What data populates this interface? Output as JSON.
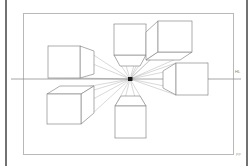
{
  "diagram": {
    "type": "one-point-perspective-construction",
    "horizon_label": "HL",
    "corner_mark": "PP",
    "colors": {
      "paper": "#ffffff",
      "frame_stroke": "#b4b4b4",
      "cube_stroke": "#8c8c8c",
      "ray_stroke": "#a8a8a8",
      "horizon_stroke": "#909090",
      "vanishing_point": "#1a1a1a",
      "scan_edge": "#4a4a4a"
    },
    "frame": {
      "x": 23,
      "y": 13,
      "width": 211,
      "height": 142
    },
    "horizon": {
      "y": 79,
      "x_start": 11,
      "x_end": 241
    },
    "vanishing_point": {
      "x": 130,
      "y": 79,
      "label": "VP"
    },
    "cubes": [
      {
        "name": "top-center-cube",
        "position": "above-vp",
        "visible_face": "bottom"
      },
      {
        "name": "top-right-cube",
        "position": "upper-right-of-vp",
        "visible_face": "bottom-left"
      },
      {
        "name": "upper-left-cube",
        "position": "left-above-horizon",
        "visible_face": "right"
      },
      {
        "name": "lower-left-cube",
        "position": "left-below-horizon",
        "visible_face": "top-right"
      },
      {
        "name": "right-cube",
        "position": "right-on-horizon",
        "visible_face": "left"
      },
      {
        "name": "bottom-center-cube",
        "position": "below-vp",
        "visible_face": "top"
      }
    ]
  }
}
